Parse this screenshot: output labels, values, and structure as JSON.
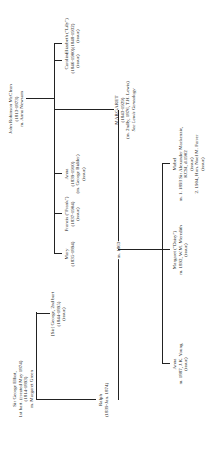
{
  "root_mcclean": {
    "name": "John Robinson McClean",
    "dates": "(1813-1873)",
    "spouse": "m. Anna Newsam"
  },
  "mcclean_children": [
    {
      "name": "Mary",
      "dates": "(1835-1894)",
      "note": ""
    },
    {
      "name": "Francis (\"Frank\")",
      "dates": "(1837-1904)",
      "note": "(issue)"
    },
    {
      "name": "Anna",
      "dates": "(1839-1910)",
      "note": "(m. George Bidder)",
      "note2": "(issue)"
    },
    {
      "name": "MARGARET",
      "dates": "(1843-1929)",
      "note": "(m. 2ndly, 1876, T.H. Lewis)",
      "note2": "See Lewis Genealogy"
    },
    {
      "name": "Caroline",
      "dates": "(1846-1900)",
      "note": "(issue)"
    },
    {
      "name": "Elizabeth (\"Lily\")",
      "dates": "(1848-1932)",
      "note": "(issue)"
    }
  ],
  "root_elliot": {
    "name": "Sir George Elliot,",
    "title": "1st bart. (created May 1874)",
    "dates": "(1814-1893)",
    "spouse": "m. Margaret Green"
  },
  "elliot_children": [
    {
      "name": "[Sir] George, 2nd bart",
      "dates": "(1844-1895)",
      "note": "(issue)"
    },
    {
      "name": "Ralph",
      "dates": "(1839-Jan. 1874)"
    }
  ],
  "marriage": {
    "label": "m. 1863"
  },
  "grandchildren": [
    {
      "name": "Anna",
      "note": "m. 1887, J.K. Young",
      "note2": "(issue)"
    },
    {
      "name": "Margaret (\"Daisy\")",
      "note": "m. 1892, W.M. Meredith",
      "note2": "(issue)"
    },
    {
      "name": "Mabel",
      "note": "m. 1. 1893 Sir Alexander Mackenzie,",
      "note2": "KCSI, d.1902",
      "note3": "(issue)",
      "note4": "2. 1904, Hon. Noel M. Farrer",
      "note5": "(issue)"
    }
  ]
}
